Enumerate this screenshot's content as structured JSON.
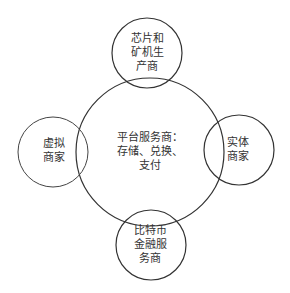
{
  "diagram": {
    "type": "venn-hub",
    "stroke_color": "#333333",
    "center": {
      "label": "平台服务商：\n存储、兑换、\n支付",
      "cx": 150,
      "cy": 152,
      "r": 74
    },
    "satellites": [
      {
        "id": "top",
        "label": "芯片和\n矿机生\n产商",
        "cx": 147,
        "cy": 53,
        "r": 35
      },
      {
        "id": "left",
        "label": "虚拟\n商家",
        "cx": 53,
        "cy": 152,
        "r": 35
      },
      {
        "id": "right",
        "label": "实体\n商家",
        "cx": 239,
        "cy": 150,
        "r": 35
      },
      {
        "id": "bottom",
        "label": "比特币\n金融服\n务商",
        "cx": 151,
        "cy": 245,
        "r": 35
      }
    ]
  }
}
